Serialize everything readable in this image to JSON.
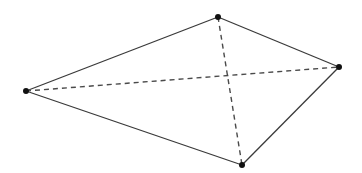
{
  "diagram": {
    "type": "quadrilateral-with-diagonals",
    "vertices": [
      {
        "id": "left",
        "x": 26,
        "y": 91
      },
      {
        "id": "top",
        "x": 218,
        "y": 17
      },
      {
        "id": "right",
        "x": 339,
        "y": 67
      },
      {
        "id": "bottom",
        "x": 242,
        "y": 165
      }
    ],
    "edges": [
      {
        "from": "left",
        "to": "top",
        "style": "solid"
      },
      {
        "from": "top",
        "to": "right",
        "style": "solid"
      },
      {
        "from": "right",
        "to": "bottom",
        "style": "solid"
      },
      {
        "from": "bottom",
        "to": "left",
        "style": "solid"
      }
    ],
    "diagonals": [
      {
        "from": "left",
        "to": "right",
        "style": "dashed"
      },
      {
        "from": "top",
        "to": "bottom",
        "style": "dashed"
      }
    ],
    "colors": {
      "line": "#3a3a3a",
      "vertex": "#111111",
      "background": "#ffffff"
    }
  }
}
